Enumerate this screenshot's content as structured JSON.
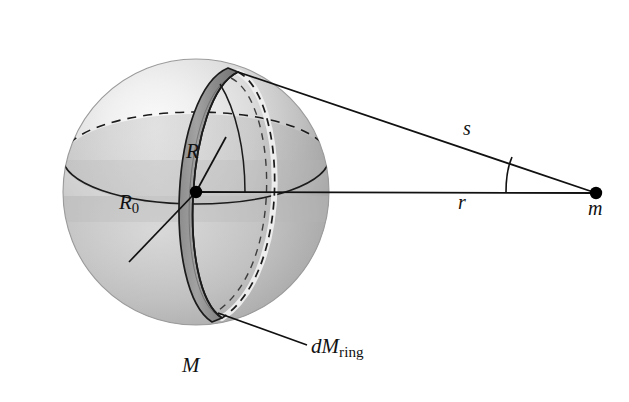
{
  "figure": {
    "background_color": "#ffffff",
    "width": 629,
    "height": 402
  },
  "labels": {
    "ring_radius": "R",
    "sphere_radius_base": "R",
    "sphere_radius_sub": "0",
    "distance_ring_to_mass": "s",
    "distance_center_to_mass": "r",
    "test_mass": "m",
    "sphere_mass": "M",
    "ring_mass_base": "dM",
    "ring_mass_sub": "ring"
  },
  "colors": {
    "sphere_light": "#f2f2f2",
    "sphere_mid": "#c9c9c9",
    "sphere_dark": "#8f8f8f",
    "sphere_shadow": "#7d7d7d",
    "equator_band": "#b4b4b4",
    "ring_face": "#9a9a9a",
    "ring_dark": "#6f6f6f",
    "ring_highlight": "#ededed",
    "line": "#111111",
    "dot": "#000000"
  },
  "geometry": {
    "sphere_center": [
      196,
      192
    ],
    "sphere_radius_px": 133,
    "mass_point": [
      596,
      193
    ],
    "ring_top": [
      238,
      72
    ],
    "ring_bottom": [
      222,
      318
    ],
    "angle_arc_at_mass": true,
    "angle_arc_at_center": true
  },
  "elements": {
    "sphere": "shaded-sphere",
    "equator_ellipse": "dashed-back-solid-front",
    "ring": "tilted-annular-band",
    "line_s": "ring-top-to-mass",
    "line_r": "center-to-mass",
    "line_R": "center-to-ring",
    "line_R0": "center-to-surface",
    "leader_dM": "ring-bottom-to-label"
  }
}
